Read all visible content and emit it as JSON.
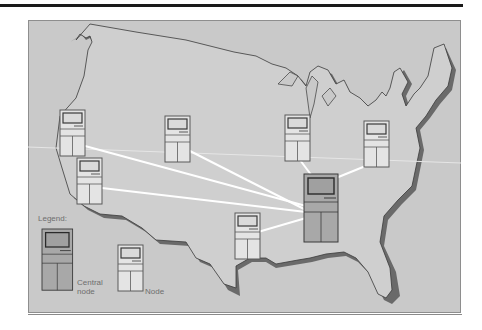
{
  "figure": {
    "legend": {
      "title": "Legend:",
      "central_label_line1": "Central",
      "central_label_line2": "node",
      "node_label": "Node"
    },
    "colors": {
      "background": "#c9c9c9",
      "land": "#cfcfcf",
      "shadow": "#6a6a6a",
      "outline": "#3a3a3a",
      "link": "#ffffff",
      "node_fill": "#e4e4e4",
      "central_fill": "#a8a8a8",
      "node_stroke": "#5a5a5a"
    },
    "central_node": {
      "id": "central",
      "x": 304,
      "y": 174,
      "w": 34,
      "h": 68
    },
    "nodes": [
      {
        "id": "california-north",
        "x": 60,
        "y": 110,
        "w": 25,
        "h": 46
      },
      {
        "id": "california-south",
        "x": 77,
        "y": 158,
        "w": 25,
        "h": 47
      },
      {
        "id": "mountain",
        "x": 165,
        "y": 116,
        "w": 25,
        "h": 47
      },
      {
        "id": "midwest",
        "x": 285,
        "y": 115,
        "w": 25,
        "h": 46
      },
      {
        "id": "east",
        "x": 363,
        "y": 121,
        "w": 27,
        "h": 46
      },
      {
        "id": "texas",
        "x": 235,
        "y": 213,
        "w": 25,
        "h": 47
      }
    ]
  }
}
